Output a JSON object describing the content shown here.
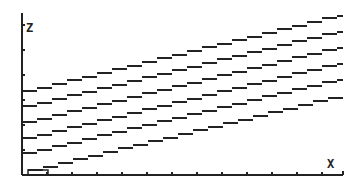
{
  "chart_data": {
    "type": "line",
    "title": "",
    "xlabel": "X",
    "ylabel": "Z",
    "grid": false,
    "legend": null,
    "style": "graphing-calculator pixel plot",
    "colors": {
      "background": "#ffffff",
      "ink": "#222222"
    },
    "axes_px": {
      "origin": [
        22,
        175
      ],
      "x_end": 343,
      "y_top": 13,
      "x_tick_spacing": 25,
      "y_tick_spacing": 25
    },
    "series": [
      {
        "name": "line-1",
        "points_px": [
          [
            22,
            93
          ],
          [
            343,
            15
          ]
        ]
      },
      {
        "name": "line-2",
        "points_px": [
          [
            22,
            108
          ],
          [
            343,
            31
          ]
        ]
      },
      {
        "name": "line-3",
        "points_px": [
          [
            22,
            124
          ],
          [
            343,
            47
          ]
        ]
      },
      {
        "name": "line-4",
        "points_px": [
          [
            22,
            140
          ],
          [
            343,
            63
          ]
        ]
      },
      {
        "name": "line-5",
        "points_px": [
          [
            22,
            155
          ],
          [
            343,
            79
          ]
        ]
      },
      {
        "name": "line-6",
        "points_px": [
          [
            28,
            172
          ],
          [
            343,
            96
          ]
        ]
      }
    ],
    "annotations": [
      {
        "type": "cursor-box",
        "px": [
          28,
          170,
          20,
          5
        ]
      }
    ]
  },
  "labels": {
    "y_axis": "Z",
    "x_axis": "X"
  }
}
